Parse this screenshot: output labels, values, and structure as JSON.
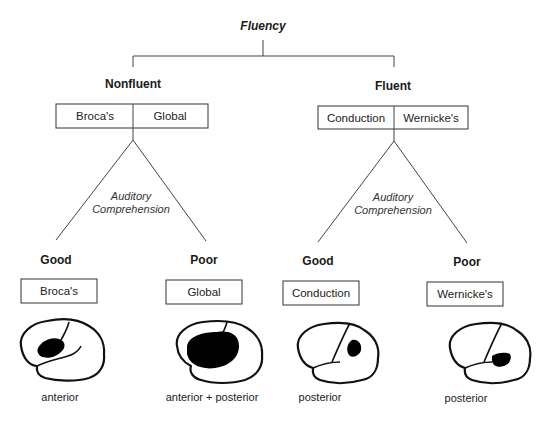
{
  "title": "Fluency",
  "branches": [
    {
      "label": "Nonfluent",
      "types": [
        "Broca's",
        "Global"
      ],
      "split_label": [
        "Auditory",
        "Comprehension"
      ],
      "outcomes": [
        {
          "comprehension": "Good",
          "type": "Broca's",
          "lesion_site": "anterior"
        },
        {
          "comprehension": "Poor",
          "type": "Global",
          "lesion_site": "anterior + posterior"
        }
      ]
    },
    {
      "label": "Fluent",
      "types": [
        "Conduction",
        "Wernicke's"
      ],
      "split_label": [
        "Auditory",
        "Comprehension"
      ],
      "outcomes": [
        {
          "comprehension": "Good",
          "type": "Conduction",
          "lesion_site": "posterior"
        },
        {
          "comprehension": "Poor",
          "type": "Wernicke's",
          "lesion_site": "posterior"
        }
      ]
    }
  ],
  "colors": {
    "line": "#444444",
    "lesion": "#000000",
    "background": "#ffffff"
  }
}
